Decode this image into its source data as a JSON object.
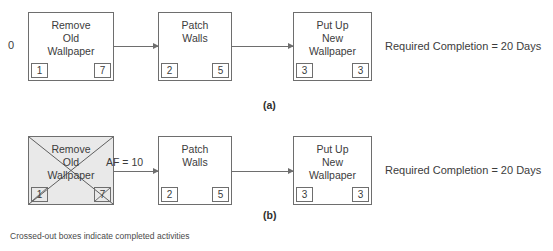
{
  "figure": {
    "footnote": "Crossed-out boxes indicate completed activities",
    "colors": {
      "box_border": "#6e6e6e",
      "completed_fill": "#e9e9e9",
      "text": "#3c3c3c",
      "background": "#ffffff"
    }
  },
  "panels": [
    {
      "id": "a",
      "caption": "(a)",
      "start_label": "0",
      "note": "Required Completion = 20 Days",
      "arrow_label": "",
      "nodes": [
        {
          "id": "remove-old-wallpaper",
          "name": "Remove\nOld\nWallpaper",
          "left_value": "1",
          "right_value": "7",
          "completed": false
        },
        {
          "id": "patch-walls",
          "name": "Patch\nWalls",
          "left_value": "2",
          "right_value": "5",
          "completed": false
        },
        {
          "id": "put-up-new-wallpaper",
          "name": "Put Up\nNew\nWallpaper",
          "left_value": "3",
          "right_value": "3",
          "completed": false
        }
      ]
    },
    {
      "id": "b",
      "caption": "(b)",
      "start_label": "",
      "note": "Required Completion = 20 Days",
      "arrow_label": "AF = 10",
      "nodes": [
        {
          "id": "remove-old-wallpaper",
          "name": "Remove\nOld\nWallpaper",
          "left_value": "1",
          "right_value": "7",
          "completed": true
        },
        {
          "id": "patch-walls",
          "name": "Patch\nWalls",
          "left_value": "2",
          "right_value": "5",
          "completed": false
        },
        {
          "id": "put-up-new-wallpaper",
          "name": "Put Up\nNew\nWallpaper",
          "left_value": "3",
          "right_value": "3",
          "completed": false
        }
      ]
    }
  ]
}
